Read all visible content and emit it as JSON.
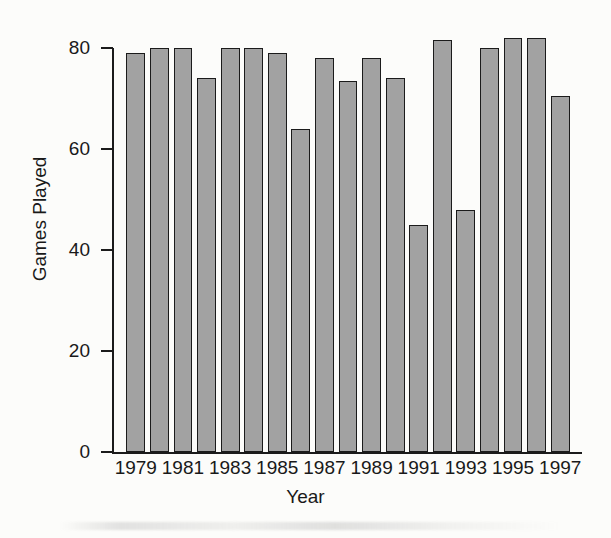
{
  "page": {
    "title_remnant": "the descenders of a cropped title line",
    "background_color": "#fcfcfa"
  },
  "chart_data": {
    "type": "bar",
    "title": "",
    "xlabel": "Year",
    "ylabel": "Games Played",
    "categories": [
      "1979",
      "1980",
      "1981",
      "1982",
      "1983",
      "1984",
      "1985",
      "1986",
      "1987",
      "1988",
      "1989",
      "1990",
      "1991",
      "1992",
      "1993",
      "1994",
      "1995",
      "1996",
      "1997"
    ],
    "values": [
      79,
      80,
      80,
      74,
      80,
      80,
      79,
      64,
      78,
      73.5,
      78,
      74,
      45,
      81.5,
      48,
      80,
      82,
      82,
      70.5
    ],
    "ylim": [
      0,
      80
    ],
    "xlim": [
      "1979",
      "1997"
    ],
    "y_ticks": [
      "0",
      "20",
      "40",
      "60",
      "80"
    ],
    "y_tick_values": [
      0,
      20,
      40,
      60,
      80
    ],
    "x_ticks": [
      "1979",
      "1981",
      "1983",
      "1985",
      "1987",
      "1989",
      "1991",
      "1993",
      "1995",
      "1997"
    ],
    "grid": false,
    "legend": null,
    "bar_fill_color": "#a2a2a2",
    "bar_edge_color": "#1b1b1b",
    "axis_color": "#1b1b1b",
    "text_color": "#191919"
  }
}
